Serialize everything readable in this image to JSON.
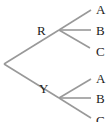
{
  "diagram": {
    "type": "tree",
    "line_color": "#999999",
    "text_color": "#222222",
    "first_level": [
      {
        "label": "R",
        "children": [
          "A",
          "B",
          "C"
        ]
      },
      {
        "label": "Y",
        "children": [
          "A",
          "B",
          "C"
        ]
      }
    ]
  }
}
